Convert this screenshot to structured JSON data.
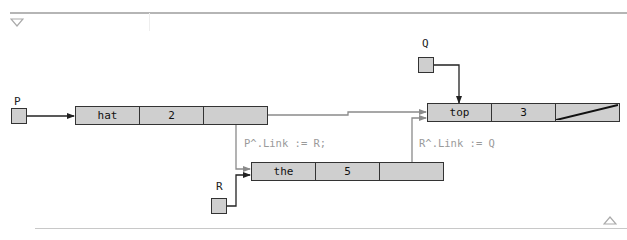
{
  "toolbar": {
    "collapse_icon": "triangle-down",
    "expand_icon": "triangle-up"
  },
  "pointers": {
    "P": {
      "label": "P"
    },
    "Q": {
      "label": "Q"
    },
    "R": {
      "label": "R"
    }
  },
  "nodes": [
    {
      "id": "hat",
      "data": "hat",
      "count": "2",
      "link": "pointer"
    },
    {
      "id": "top",
      "data": "top",
      "count": "3",
      "link": "nil"
    },
    {
      "id": "the",
      "data": "the",
      "count": "5",
      "link": "pointer"
    }
  ],
  "statements": {
    "p_link": "P^.Link := R;",
    "r_link": "R^.Link := Q"
  },
  "colors": {
    "node_fill": "#cfcfcf",
    "border": "#333333",
    "new_link": "#8a8a8a",
    "old_link": "#222222"
  }
}
